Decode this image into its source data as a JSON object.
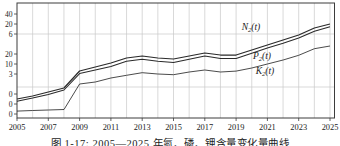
{
  "figure": {
    "caption": "图 1-17: 2005—2025 年氮、磷、钾含量变化量曲线"
  },
  "colors": {
    "curve": "#2b2b2b",
    "frame": "#3c3c3c",
    "grid": "#c9c9c9",
    "text": "#1c1c1c",
    "background": "#ffffff"
  },
  "chart_data": {
    "type": "line",
    "title": "",
    "xlabel": "",
    "ylabel": "",
    "x_years": [
      2005,
      2006,
      2007,
      2008,
      2009,
      2010,
      2011,
      2012,
      2013,
      2014,
      2015,
      2016,
      2017,
      2018,
      2019,
      2020,
      2021,
      2022,
      2023,
      2024,
      2025
    ],
    "x_tick_labels": [
      "2005",
      "2007",
      "2009",
      "2011",
      "2013",
      "2015",
      "2017",
      "2019",
      "2021",
      "2023",
      "2025"
    ],
    "xlim": [
      2005,
      2025
    ],
    "grid": {
      "vertical": "every-year",
      "horizontal": "sparse"
    },
    "axes_note": "three interleaved left y-axis scales, one per series, each with ticks max/mid/0",
    "series": [
      {
        "id": "N2",
        "label_base": "N",
        "label_sub": "2",
        "label_arg": "(t)",
        "axis_ticks": [
          "40",
          "20",
          "0"
        ],
        "axis_range": [
          0,
          40
        ],
        "values": [
          -2.5,
          -1.0,
          1.0,
          3.0,
          11.5,
          13.5,
          15.5,
          18.0,
          19.0,
          18.0,
          17.5,
          19.0,
          20.5,
          19.5,
          19.5,
          22.0,
          24.5,
          27.0,
          29.5,
          33.0,
          35.0
        ]
      },
      {
        "id": "P2",
        "label_base": "P",
        "label_sub": "2",
        "label_arg": "(t)",
        "axis_ticks": [
          "20",
          "10",
          "0"
        ],
        "axis_range": [
          0,
          20
        ],
        "values": [
          0.7,
          1.5,
          2.4,
          3.5,
          7.6,
          8.5,
          9.4,
          10.7,
          11.2,
          10.7,
          10.4,
          11.2,
          12.0,
          11.4,
          11.4,
          12.7,
          14.0,
          15.2,
          16.5,
          18.2,
          19.3
        ]
      },
      {
        "id": "K2",
        "label_base": "K",
        "label_sub": "2",
        "label_arg": "(t)",
        "axis_ticks": [
          "6",
          "3",
          "0"
        ],
        "axis_range": [
          0,
          6
        ],
        "values": [
          0.22,
          0.26,
          0.3,
          0.34,
          2.25,
          2.4,
          2.7,
          2.9,
          3.1,
          3.0,
          2.95,
          3.15,
          3.3,
          3.15,
          3.22,
          3.45,
          3.75,
          4.05,
          4.4,
          4.9,
          5.1
        ]
      }
    ]
  }
}
